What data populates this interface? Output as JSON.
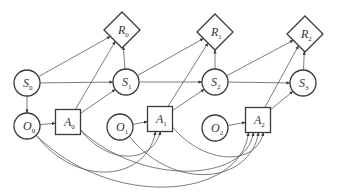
{
  "diagram": {
    "type": "dynamic-influence-diagram",
    "nodes": [
      {
        "id": "S0",
        "shape": "circle",
        "label": "S",
        "sub": "0",
        "cx": 27,
        "cy": 83
      },
      {
        "id": "O0",
        "shape": "circle",
        "label": "O",
        "sub": "0",
        "cx": 27,
        "cy": 126
      },
      {
        "id": "A0",
        "shape": "square",
        "label": "A",
        "sub": "0",
        "cx": 68,
        "cy": 122
      },
      {
        "id": "R0",
        "shape": "diamond",
        "label": "R",
        "sub": "0",
        "cx": 122,
        "cy": 30
      },
      {
        "id": "S1",
        "shape": "circle",
        "label": "S",
        "sub": "1",
        "cx": 126,
        "cy": 82
      },
      {
        "id": "O1",
        "shape": "circle",
        "label": "O",
        "sub": "1",
        "cx": 120,
        "cy": 127
      },
      {
        "id": "A1",
        "shape": "square",
        "label": "A",
        "sub": "1",
        "cx": 160,
        "cy": 119
      },
      {
        "id": "R1",
        "shape": "diamond",
        "label": "R",
        "sub": "1",
        "cx": 215,
        "cy": 32
      },
      {
        "id": "S2",
        "shape": "circle",
        "label": "S",
        "sub": "2",
        "cx": 215,
        "cy": 82
      },
      {
        "id": "O2",
        "shape": "circle",
        "label": "O",
        "sub": "2",
        "cx": 215,
        "cy": 128
      },
      {
        "id": "A2",
        "shape": "square",
        "label": "A",
        "sub": "2",
        "cx": 258,
        "cy": 120
      },
      {
        "id": "R2",
        "shape": "diamond",
        "label": "R",
        "sub": "2",
        "cx": 305,
        "cy": 34
      },
      {
        "id": "S3",
        "shape": "circle",
        "label": "S",
        "sub": "3",
        "cx": 303,
        "cy": 83
      }
    ],
    "edges": [
      {
        "from": "S0",
        "to": "R0"
      },
      {
        "from": "S0",
        "to": "S1"
      },
      {
        "from": "S0",
        "to": "O0"
      },
      {
        "from": "O0",
        "to": "A0"
      },
      {
        "from": "A0",
        "to": "R0"
      },
      {
        "from": "A0",
        "to": "S1"
      },
      {
        "from": "S1",
        "to": "R0"
      },
      {
        "from": "S1",
        "to": "R1"
      },
      {
        "from": "S1",
        "to": "S2"
      },
      {
        "from": "O1",
        "to": "A1"
      },
      {
        "from": "A1",
        "to": "R1"
      },
      {
        "from": "A1",
        "to": "S2"
      },
      {
        "from": "S2",
        "to": "R1"
      },
      {
        "from": "S2",
        "to": "R2"
      },
      {
        "from": "S2",
        "to": "S3"
      },
      {
        "from": "O2",
        "to": "A2"
      },
      {
        "from": "A2",
        "to": "R2"
      },
      {
        "from": "A2",
        "to": "S3"
      },
      {
        "from": "S3",
        "to": "R2"
      },
      {
        "from": "O0",
        "to": "A1",
        "curved": true
      },
      {
        "from": "A0",
        "to": "A1",
        "curved": true
      },
      {
        "from": "O0",
        "to": "A2",
        "curved": true
      },
      {
        "from": "A0",
        "to": "A2",
        "curved": true
      },
      {
        "from": "O1",
        "to": "A2",
        "curved": true
      },
      {
        "from": "A1",
        "to": "A2",
        "curved": true
      }
    ],
    "colors": {
      "stroke": "#3a3a3a",
      "edge": "#5a5a5a",
      "background": "#ffffff"
    }
  }
}
